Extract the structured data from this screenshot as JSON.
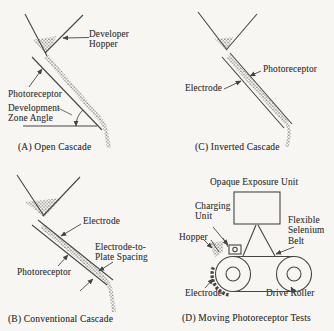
{
  "figure": {
    "paper_color": "#f7f6f2",
    "ink_color": "#454545"
  },
  "panels": {
    "a": {
      "caption": "(A) Open Cascade",
      "labels": {
        "developer_hopper": "Developer\nHopper",
        "photoreceptor": "Photoreceptor",
        "development_zone_angle": "Development\nZone Angle"
      }
    },
    "c": {
      "caption": "(C) Inverted Cascade",
      "labels": {
        "photoreceptor": "Photoreceptor",
        "electrode": "Electrode"
      }
    },
    "b": {
      "caption": "(B) Conventional Cascade",
      "labels": {
        "electrode": "Electrode",
        "electrode_to_plate_spacing": "Electrode-to-\nPlate Spacing",
        "photoreceptor": "Photoreceptor"
      }
    },
    "d": {
      "caption": "(D) Moving Photoreceptor Tests",
      "labels": {
        "opaque_exposure_unit": "Opaque Exposure Unit",
        "charging_unit": "Charging\nUnit",
        "flexible_selenium_belt": "Flexible\nSelenium\nBelt",
        "hopper": "Hopper",
        "electrode": "Electrode",
        "drive_roller": "Drive Roller"
      }
    }
  }
}
